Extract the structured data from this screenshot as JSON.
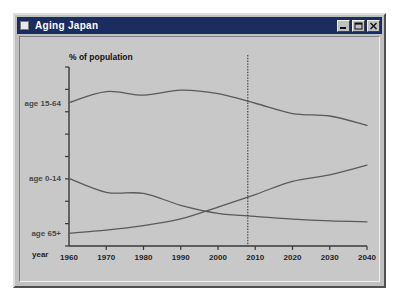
{
  "window": {
    "title": "Aging Japan",
    "icon": "window-app-icon",
    "buttons": [
      {
        "name": "minimize-button",
        "label": "_",
        "icon": "minimize-icon"
      },
      {
        "name": "maximize-button",
        "label": "□",
        "icon": "maximize-icon"
      },
      {
        "name": "close-button",
        "label": "✕",
        "icon": "close-icon"
      }
    ]
  },
  "chart_data": {
    "type": "line",
    "title": "% of population",
    "xlabel": "year",
    "ylabel": "% of population",
    "x": [
      1960,
      1970,
      1980,
      1990,
      2000,
      2010,
      2020,
      2030,
      2040
    ],
    "xlim": [
      1960,
      2040
    ],
    "ylim": [
      0,
      80
    ],
    "xticks": [
      1960,
      1970,
      1980,
      1990,
      2000,
      2010,
      2020,
      2030,
      2040
    ],
    "xtick_labels": [
      "1960",
      "1970",
      "1980",
      "1990",
      "2000",
      "2010",
      "2020",
      "2030",
      "2040"
    ],
    "yticks": [
      0,
      10,
      20,
      30,
      40,
      50,
      60,
      70,
      80
    ],
    "ytick_labels": [
      "",
      "",
      "",
      "",
      "",
      "",
      "",
      "",
      ""
    ],
    "grid": false,
    "legend": "inline-left-labels",
    "series": [
      {
        "name": "age 15-64",
        "label": "age 15-64",
        "values": [
          64.1,
          69.0,
          67.4,
          69.7,
          68.1,
          63.8,
          59.2,
          58.1,
          53.9
        ]
      },
      {
        "name": "age 0-14",
        "label": "age 0-14",
        "values": [
          30.2,
          24.0,
          23.5,
          18.2,
          14.6,
          13.2,
          12.0,
          11.2,
          10.8
        ]
      },
      {
        "name": "age 65+",
        "label": "age 65+",
        "values": [
          5.7,
          7.1,
          9.1,
          12.1,
          17.4,
          23.0,
          28.9,
          31.8,
          36.1
        ]
      }
    ],
    "annotations": [
      {
        "name": "present-year-marker",
        "type": "vertical-dotted-line",
        "x": 2008,
        "label": ""
      }
    ]
  }
}
